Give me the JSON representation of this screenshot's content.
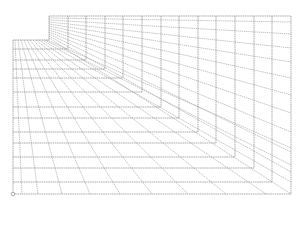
{
  "diagram": {
    "line_color": "#8a8a8a",
    "background": "#ffffff",
    "frame": {
      "top_y": 16,
      "left_x": 13,
      "right_x": 291,
      "bottom_y": 194
    },
    "corners": [
      {
        "x": 49,
        "y": 40
      },
      {
        "x": 68,
        "y": 49
      },
      {
        "x": 86,
        "y": 60
      },
      {
        "x": 105,
        "y": 69
      },
      {
        "x": 123,
        "y": 78
      },
      {
        "x": 142,
        "y": 92
      },
      {
        "x": 161,
        "y": 107
      },
      {
        "x": 179,
        "y": 118
      },
      {
        "x": 198,
        "y": 132
      },
      {
        "x": 216,
        "y": 143
      },
      {
        "x": 235,
        "y": 157
      },
      {
        "x": 254,
        "y": 168
      },
      {
        "x": 272,
        "y": 182
      },
      {
        "x": 291,
        "y": 194
      }
    ],
    "wall_rays": [
      {
        "x1": 49,
        "y1": 18,
        "x2": 291,
        "y2": 22
      },
      {
        "x1": 49,
        "y1": 20,
        "x2": 291,
        "y2": 34
      },
      {
        "x1": 49,
        "y1": 22,
        "x2": 291,
        "y2": 48
      },
      {
        "x1": 49,
        "y1": 24,
        "x2": 291,
        "y2": 62
      },
      {
        "x1": 49,
        "y1": 26,
        "x2": 291,
        "y2": 78
      },
      {
        "x1": 49,
        "y1": 28,
        "x2": 291,
        "y2": 95
      },
      {
        "x1": 49,
        "y1": 30,
        "x2": 291,
        "y2": 113
      },
      {
        "x1": 49,
        "y1": 32,
        "x2": 291,
        "y2": 132
      },
      {
        "x1": 49,
        "y1": 34,
        "x2": 291,
        "y2": 152
      },
      {
        "x1": 49,
        "y1": 36,
        "x2": 291,
        "y2": 172
      },
      {
        "x1": 49,
        "y1": 38,
        "x2": 291,
        "y2": 194
      }
    ],
    "floor_rays": [
      {
        "x1": 15,
        "y1": 40,
        "x2": 22,
        "y2": 194
      },
      {
        "x1": 18,
        "y1": 40,
        "x2": 38,
        "y2": 194
      },
      {
        "x1": 21,
        "y1": 40,
        "x2": 62,
        "y2": 194
      },
      {
        "x1": 24,
        "y1": 40,
        "x2": 90,
        "y2": 194
      },
      {
        "x1": 27,
        "y1": 40,
        "x2": 120,
        "y2": 194
      },
      {
        "x1": 30,
        "y1": 40,
        "x2": 152,
        "y2": 194
      },
      {
        "x1": 33,
        "y1": 40,
        "x2": 188,
        "y2": 194
      },
      {
        "x1": 36,
        "y1": 40,
        "x2": 226,
        "y2": 194
      },
      {
        "x1": 39,
        "y1": 40,
        "x2": 266,
        "y2": 194
      },
      {
        "x1": 42,
        "y1": 40,
        "x2": 291,
        "y2": 182
      },
      {
        "x1": 45,
        "y1": 40,
        "x2": 291,
        "y2": 165
      },
      {
        "x1": 47,
        "y1": 40,
        "x2": 291,
        "y2": 148
      }
    ],
    "origin_marker": {
      "x": 13,
      "y": 194,
      "r": 1.8
    }
  }
}
